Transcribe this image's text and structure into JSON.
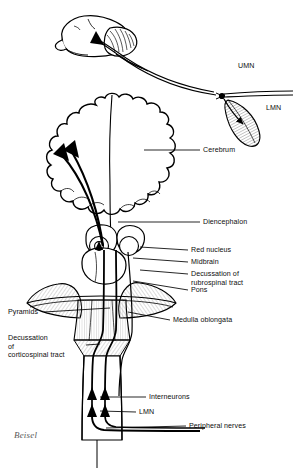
{
  "figure": {
    "signature": "Beisel",
    "ink_color": "#000000",
    "shade_color": "#8f8f8f",
    "background": "#ffffff"
  },
  "inset": {
    "name": "lateral-brain-inset",
    "umn_label": "UMN",
    "lmn_label": "LMN"
  },
  "labels": {
    "cerebrum": "Cerebrum",
    "diencephalon": "Diencephalon",
    "red_nucleus": "Red nucleus",
    "midbrain": "Midbrain",
    "decussation_rubrospinal": "Decussation of\nrubrospinal tract",
    "pons": "Pons",
    "medulla_oblongata": "Medulla oblongata",
    "pyramids": "Pyramids",
    "decussation_corticospinal": "Decussation\nof\ncorticospinal tract",
    "interneurons": "Interneurons",
    "lmn": "LMN",
    "peripheral_nerves": "Peripheral nerves"
  }
}
